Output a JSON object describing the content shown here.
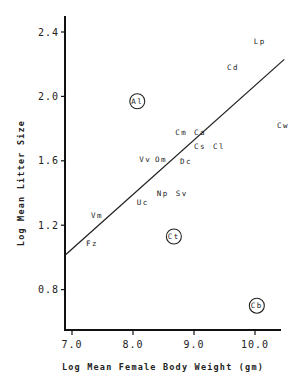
{
  "chart_data": {
    "type": "scatter",
    "title": "",
    "xlabel": "Log Mean Female Body Weight (gm)",
    "ylabel": "Log Mean Litter Size",
    "xlim": [
      6.9,
      10.5
    ],
    "ylim": [
      0.6,
      2.5
    ],
    "xticks": [
      7.0,
      8.0,
      9.0,
      10.0
    ],
    "xtick_labels": [
      "7.0",
      "8.0",
      "9.0",
      "10.0"
    ],
    "yticks": [
      0.8,
      1.2,
      1.6,
      2.0,
      2.4
    ],
    "ytick_labels": [
      "0.8",
      "1.2",
      "1.6",
      "2.0",
      "2.4"
    ],
    "grid": false,
    "legend": null,
    "points": [
      {
        "label": "Lp",
        "x": 10.08,
        "y": 2.34,
        "circled": false
      },
      {
        "label": "Cd",
        "x": 9.64,
        "y": 2.18,
        "circled": false
      },
      {
        "label": "Al",
        "x": 8.07,
        "y": 1.97,
        "circled": true
      },
      {
        "label": "Cw",
        "x": 10.46,
        "y": 1.82,
        "circled": false
      },
      {
        "label": "Cm",
        "x": 8.79,
        "y": 1.78,
        "circled": false
      },
      {
        "label": "Ca",
        "x": 9.1,
        "y": 1.78,
        "circled": false
      },
      {
        "label": "Cs",
        "x": 9.1,
        "y": 1.69,
        "circled": false
      },
      {
        "label": "Cl",
        "x": 9.41,
        "y": 1.69,
        "circled": false
      },
      {
        "label": "Vv",
        "x": 8.2,
        "y": 1.61,
        "circled": false
      },
      {
        "label": "Om",
        "x": 8.46,
        "y": 1.61,
        "circled": false
      },
      {
        "label": "Dc",
        "x": 8.87,
        "y": 1.6,
        "circled": false
      },
      {
        "label": "Np",
        "x": 8.49,
        "y": 1.4,
        "circled": false
      },
      {
        "label": "Sv",
        "x": 8.8,
        "y": 1.4,
        "circled": false
      },
      {
        "label": "Uc",
        "x": 8.16,
        "y": 1.34,
        "circled": false
      },
      {
        "label": "Vm",
        "x": 7.41,
        "y": 1.26,
        "circled": false
      },
      {
        "label": "Fz",
        "x": 7.33,
        "y": 1.09,
        "circled": false
      },
      {
        "label": "Ct",
        "x": 8.67,
        "y": 1.13,
        "circled": true
      },
      {
        "label": "Cb",
        "x": 10.03,
        "y": 0.7,
        "circled": true
      }
    ],
    "regression_line": {
      "x1": 6.89,
      "y1": 1.015,
      "x2": 10.48,
      "y2": 2.23
    }
  },
  "layout": {
    "x_px_origin": 72,
    "x_px_per_unit": 61,
    "x_origin_value": 7.0,
    "y_px_origin": 32,
    "y_px_per_unit": 161,
    "y_origin_value": 2.4,
    "axis_left_px": 65,
    "axis_bottom_px": 330,
    "axis_top_px": 16,
    "axis_right_px": 281
  }
}
